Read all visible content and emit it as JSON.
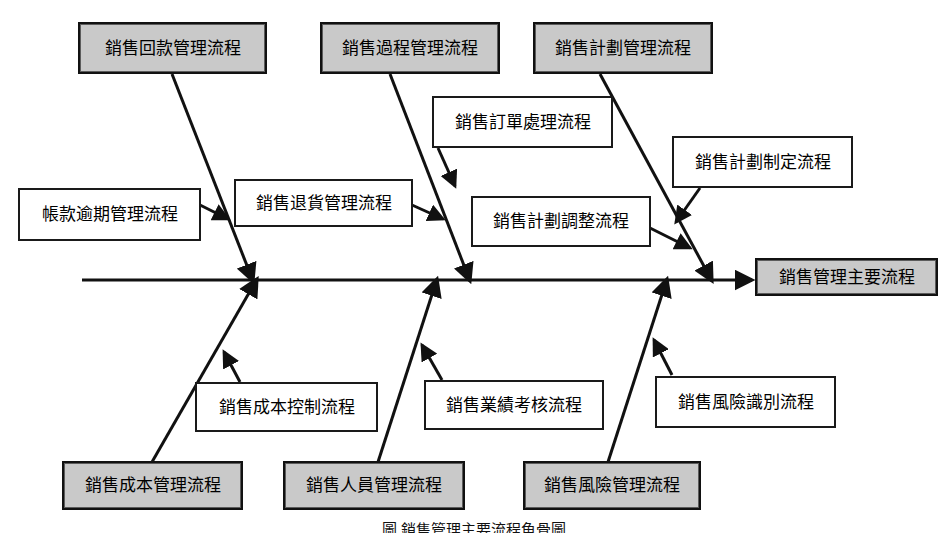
{
  "diagram": {
    "type": "fishbone",
    "title": "銷售管理主要流程",
    "caption": "圖  銷售管理主要流程魚骨圖",
    "colors": {
      "category_fill": "#c9c9c9",
      "sub_fill": "#ffffff",
      "line": "#111111",
      "text": "#000000"
    },
    "head": {
      "label": "銷售管理主要流程"
    },
    "categories": [
      {
        "id": "cat-回款",
        "label": "銷售回款管理流程",
        "side": "top",
        "subs": [
          {
            "id": "sub-帳款逾期",
            "label": "帳款逾期管理流程"
          }
        ]
      },
      {
        "id": "cat-過程",
        "label": "銷售過程管理流程",
        "side": "top",
        "subs": [
          {
            "id": "sub-退貨",
            "label": "銷售退貨管理流程"
          },
          {
            "id": "sub-訂單",
            "label": "銷售訂單處理流程"
          }
        ]
      },
      {
        "id": "cat-計劃",
        "label": "銷售計劃管理流程",
        "side": "top",
        "subs": [
          {
            "id": "sub-計劃調整",
            "label": "銷售計劃調整流程"
          },
          {
            "id": "sub-計劃制定",
            "label": "銷售計劃制定流程"
          }
        ]
      },
      {
        "id": "cat-成本",
        "label": "銷售成本管理流程",
        "side": "bottom",
        "subs": [
          {
            "id": "sub-成本控制",
            "label": "銷售成本控制流程"
          }
        ]
      },
      {
        "id": "cat-人員",
        "label": "銷售人員管理流程",
        "side": "bottom",
        "subs": [
          {
            "id": "sub-業績考核",
            "label": "銷售業績考核流程"
          }
        ]
      },
      {
        "id": "cat-風險",
        "label": "銷售風險管理流程",
        "side": "bottom",
        "subs": [
          {
            "id": "sub-風險識別",
            "label": "銷售風險識別流程"
          }
        ]
      }
    ]
  }
}
